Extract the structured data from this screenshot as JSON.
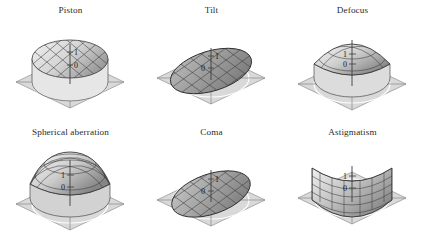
{
  "figure": {
    "background_color": "#ffffff",
    "layout": {
      "rows": 2,
      "columns": 3
    },
    "base_plane_color": "#d9d9d9",
    "base_plane_edge_color": "#8f8f8f",
    "mesh_line_color": "#3a3a3a",
    "surface_light_color": "#ececec",
    "surface_mid_color": "#c4c4c4",
    "surface_dark_color": "#8d8d8d",
    "axis_color": "#4a4a4a"
  },
  "axis": {
    "tick_top_label": "1",
    "tick_bottom_label": "0"
  },
  "panels": [
    {
      "id": "piston",
      "title": "Piston",
      "shape": "flat-disc-raised",
      "description": "Flat circular disc elevated to constant height above the base plane",
      "axis_labels": {
        "top": "1",
        "bottom": "0"
      }
    },
    {
      "id": "tilt",
      "title": "Tilt",
      "shape": "tilted-plane",
      "description": "Planar circular surface tilted about a diameter, intersecting the base plane",
      "axis_labels": {
        "top": "1",
        "bottom": "0"
      }
    },
    {
      "id": "defocus",
      "title": "Defocus",
      "shape": "paraboloid-dome",
      "description": "Convex rotationally symmetric dome rising from the rim to a central peak",
      "axis_labels": {
        "top": "1",
        "bottom": "0"
      }
    },
    {
      "id": "spherical-aberration",
      "title": "Spherical aberration",
      "shape": "flattened-dome",
      "description": "Rotationally symmetric dome with a flattened crown, steeper near the rim",
      "axis_labels": {
        "top": "1",
        "bottom": "0"
      }
    },
    {
      "id": "coma",
      "title": "Coma",
      "shape": "tilted-cubic-surface",
      "description": "Tilted surface with an S-shaped cubic profile along one diameter",
      "axis_labels": {
        "top": "1",
        "bottom": "0"
      }
    },
    {
      "id": "astigmatism",
      "title": "Astigmatism",
      "shape": "saddle",
      "description": "Hyperbolic paraboloid saddle, rising on one axis and falling on the other",
      "axis_labels": {
        "top": "1",
        "bottom": "0"
      }
    }
  ]
}
